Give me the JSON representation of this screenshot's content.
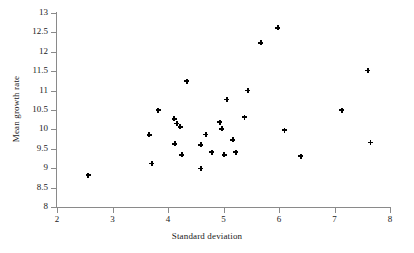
{
  "chart_data": {
    "type": "scatter",
    "title": "",
    "xlabel": "Standard deviation",
    "ylabel": "Mean growth rate",
    "xlim": [
      2,
      8
    ],
    "ylim": [
      8,
      13
    ],
    "xticks": [
      "2",
      "3",
      "4",
      "5",
      "6",
      "7",
      "8"
    ],
    "yticks": [
      "8",
      "8.5",
      "9",
      "9.5",
      "10",
      "10.5",
      "11",
      "11.5",
      "12",
      "12.5",
      "13"
    ],
    "xtick_values": [
      2,
      3,
      4,
      5,
      6,
      7,
      8
    ],
    "ytick_values": [
      8,
      8.5,
      9,
      9.5,
      10,
      10.5,
      11,
      11.5,
      12,
      12.5,
      13
    ],
    "grid": false,
    "legend": null,
    "marker": "plus-diamond",
    "marker_color": "#000000",
    "axis_color": "#8a8a8a",
    "points": [
      {
        "x": 2.56,
        "y": 8.82
      },
      {
        "x": 3.66,
        "y": 9.86
      },
      {
        "x": 3.71,
        "y": 9.12
      },
      {
        "x": 3.82,
        "y": 10.5
      },
      {
        "x": 4.11,
        "y": 10.27
      },
      {
        "x": 4.12,
        "y": 9.63
      },
      {
        "x": 4.16,
        "y": 10.15
      },
      {
        "x": 4.22,
        "y": 10.07
      },
      {
        "x": 4.25,
        "y": 9.35
      },
      {
        "x": 4.34,
        "y": 11.24
      },
      {
        "x": 4.59,
        "y": 9.6
      },
      {
        "x": 4.59,
        "y": 8.99
      },
      {
        "x": 4.68,
        "y": 9.87
      },
      {
        "x": 4.79,
        "y": 9.41
      },
      {
        "x": 4.93,
        "y": 10.19
      },
      {
        "x": 4.97,
        "y": 10.02
      },
      {
        "x": 5.01,
        "y": 9.35
      },
      {
        "x": 5.06,
        "y": 10.77
      },
      {
        "x": 5.17,
        "y": 9.73
      },
      {
        "x": 5.22,
        "y": 9.41
      },
      {
        "x": 5.38,
        "y": 10.31
      },
      {
        "x": 5.44,
        "y": 11.0
      },
      {
        "x": 5.67,
        "y": 12.23
      },
      {
        "x": 5.98,
        "y": 12.62
      },
      {
        "x": 6.1,
        "y": 9.98
      },
      {
        "x": 6.39,
        "y": 9.31
      },
      {
        "x": 7.13,
        "y": 10.5
      },
      {
        "x": 7.6,
        "y": 11.52
      },
      {
        "x": 7.65,
        "y": 9.66
      }
    ]
  }
}
